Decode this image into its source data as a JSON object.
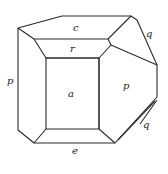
{
  "diagram": {
    "type": "crystal-form",
    "line_color": "#2a2a2a",
    "faces": {
      "c": "c",
      "r": "r",
      "a": "a",
      "p_left": "p",
      "p_right": "p",
      "q_top": "q",
      "q_bottom": "q",
      "e": "e"
    }
  }
}
